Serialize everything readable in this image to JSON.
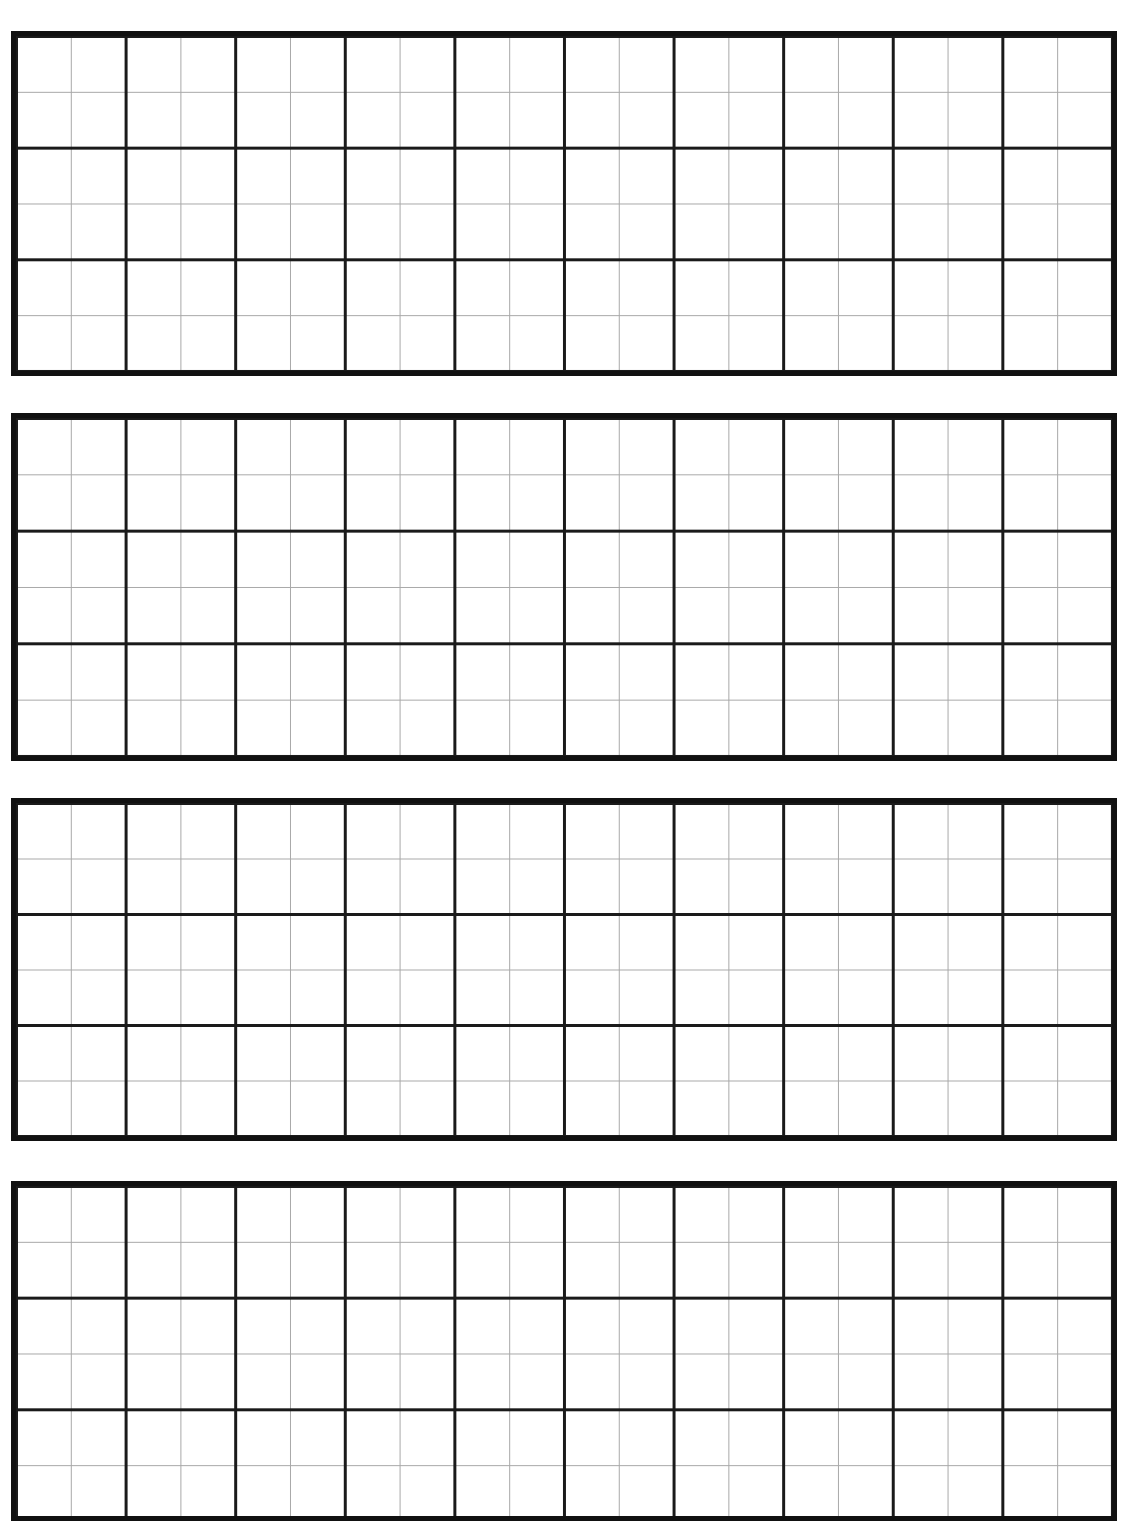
{
  "page": {
    "type": "graph-paper",
    "background_color": "#ffffff",
    "major_line_color": "#1a1a1a",
    "minor_line_color": "#a8a8a8"
  },
  "grid_blocks": [
    {
      "id": "g1",
      "major_columns": 10,
      "major_rows": 3,
      "minor_subdivisions": 2
    },
    {
      "id": "g2",
      "major_columns": 10,
      "major_rows": 3,
      "minor_subdivisions": 2
    },
    {
      "id": "g3",
      "major_columns": 10,
      "major_rows": 3,
      "minor_subdivisions": 2
    },
    {
      "id": "g4",
      "major_columns": 10,
      "major_rows": 3,
      "minor_subdivisions": 2,
      "cropped": true
    }
  ]
}
